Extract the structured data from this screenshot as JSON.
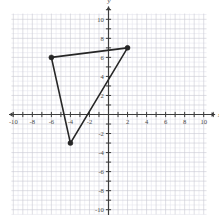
{
  "figure": {
    "width": 219,
    "height": 215,
    "background": "#ffffff"
  },
  "chart_data": {
    "type": "scatter",
    "title": "",
    "subtitle": "",
    "xlabel": "x",
    "ylabel": "y",
    "xlim": [
      -11,
      11
    ],
    "ylim": [
      -11,
      11
    ],
    "grid": true,
    "grid_major_step": 1,
    "grid_minor_step": 0.5,
    "legend": "none",
    "x_ticks": [
      -10,
      -8,
      -6,
      -4,
      -2,
      2,
      4,
      6,
      8,
      10
    ],
    "y_ticks": [
      10,
      8,
      6,
      4,
      2,
      -2,
      -4,
      -6,
      -8,
      -10
    ],
    "x_tick_labels": [
      "-10",
      "-8",
      "-6",
      "-4",
      "-2",
      "2",
      "4",
      "6",
      "8",
      "10"
    ],
    "y_tick_labels": [
      "10",
      "8",
      "6",
      "4",
      "2",
      "-2",
      "-4",
      "-6",
      "-8",
      "-10"
    ],
    "shapes": [
      {
        "name": "triangle",
        "kind": "polygon",
        "closed": true,
        "stroke": "#262626",
        "stroke_width": 1.6,
        "fill": "none",
        "vertices": [
          {
            "label": "A",
            "x": -6,
            "y": 6
          },
          {
            "label": "B",
            "x": 2,
            "y": 7
          },
          {
            "label": "C",
            "x": -4,
            "y": -3
          }
        ]
      }
    ],
    "points": [
      {
        "x": -6,
        "y": 6,
        "marker": "filled-circle",
        "color": "#262626",
        "size": 5
      },
      {
        "x": 2,
        "y": 7,
        "marker": "filled-circle",
        "color": "#262626",
        "size": 5
      },
      {
        "x": -4,
        "y": -3,
        "marker": "filled-circle",
        "color": "#262626",
        "size": 5
      }
    ],
    "colors": {
      "axis": "#3c3c3c",
      "grid_major": "#c9c9d4",
      "grid_minor": "#e6e6ee",
      "shape_stroke": "#262626",
      "tick_text": "#4a4a4a"
    }
  }
}
